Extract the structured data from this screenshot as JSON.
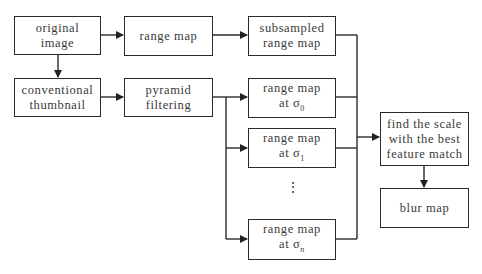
{
  "diagram": {
    "nodes": [
      {
        "id": "original_image",
        "lines": [
          "original",
          "image"
        ]
      },
      {
        "id": "range_map",
        "lines": [
          "range map"
        ]
      },
      {
        "id": "subsampled_range_map",
        "lines": [
          "subsampled",
          "range map"
        ]
      },
      {
        "id": "conventional_thumbnail",
        "lines": [
          "conventional",
          "thumbnail"
        ]
      },
      {
        "id": "pyramid_filtering",
        "lines": [
          "pyramid",
          "filtering"
        ]
      },
      {
        "id": "range_map_sigma0",
        "lines": [
          "range map",
          "at σ"
        ],
        "subscript": "0"
      },
      {
        "id": "range_map_sigma1",
        "lines": [
          "range map",
          "at σ"
        ],
        "subscript": "1"
      },
      {
        "id": "range_map_sigman",
        "lines": [
          "range map",
          "at σ"
        ],
        "subscript": "n"
      },
      {
        "id": "find_scale",
        "lines": [
          "find the scale",
          "with the best",
          "feature match"
        ]
      },
      {
        "id": "blur_map",
        "lines": [
          "blur map"
        ]
      }
    ],
    "ellipsis": "⋮",
    "edges": [
      [
        "original_image",
        "range_map"
      ],
      [
        "range_map",
        "subsampled_range_map"
      ],
      [
        "original_image",
        "conventional_thumbnail"
      ],
      [
        "conventional_thumbnail",
        "pyramid_filtering"
      ],
      [
        "pyramid_filtering",
        "range_map_sigma0"
      ],
      [
        "pyramid_filtering",
        "range_map_sigma1"
      ],
      [
        "pyramid_filtering",
        "range_map_sigman"
      ],
      [
        "subsampled_range_map",
        "find_scale"
      ],
      [
        "range_map_sigma0",
        "find_scale"
      ],
      [
        "range_map_sigma1",
        "find_scale"
      ],
      [
        "range_map_sigman",
        "find_scale"
      ],
      [
        "find_scale",
        "blur_map"
      ]
    ]
  }
}
